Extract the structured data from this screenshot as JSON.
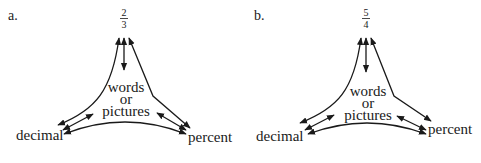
{
  "panels": [
    {
      "label": "a.",
      "fraction": {
        "numerator": "2",
        "denominator": "3"
      },
      "center": {
        "line1": "words",
        "line2": "or",
        "line3": "pictures"
      },
      "left_node": "decimal",
      "right_node": "percent"
    },
    {
      "label": "b.",
      "fraction": {
        "numerator": "5",
        "denominator": "4"
      },
      "center": {
        "line1": "words",
        "line2": "or",
        "line3": "pictures"
      },
      "left_node": "decimal",
      "right_node": "percent"
    }
  ],
  "colors": {
    "ink": "#1a1a1a",
    "background": "#ffffff"
  }
}
